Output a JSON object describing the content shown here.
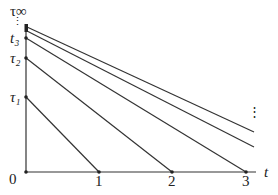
{
  "diagram": {
    "y_labels": [
      {
        "text": "τ∞",
        "y": 22
      },
      {
        "text": "⋮",
        "y": 30
      },
      {
        "text": "t3",
        "y": 38
      },
      {
        "text": "τ2",
        "y": 58
      },
      {
        "text": "τ1",
        "y": 97
      }
    ],
    "y_label_tau_inf": "τ∞",
    "y_label_dots": "⋮",
    "y_label_t3": "t₃",
    "y_label_tau2": "τ₂",
    "y_label_tau1": "τ₁",
    "x_labels": {
      "origin": "0",
      "one": "1",
      "two": "2",
      "three": "3",
      "axis": "t"
    },
    "right_dots": "⋮",
    "line_color": "#333333"
  }
}
